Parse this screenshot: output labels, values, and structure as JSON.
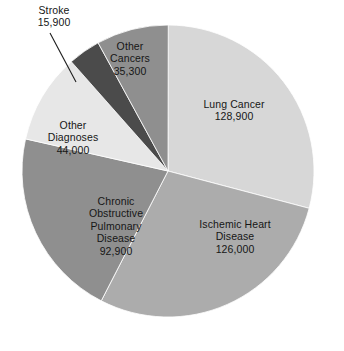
{
  "chart_data": {
    "type": "pie",
    "title": "",
    "subtitle": "",
    "xlabel": "",
    "ylabel": "",
    "legend_position": "none",
    "grid": false,
    "labels_on_slices": true,
    "total": 443000,
    "categories": [
      "Lung Cancer",
      "Ischemic Heart Disease",
      "Chronic Obstructive Pulmonary Disease",
      "Other Diagnoses",
      "Stroke",
      "Other Cancers"
    ],
    "values": [
      128900,
      126000,
      92900,
      44000,
      15900,
      35300
    ],
    "slices": [
      {
        "name": "Lung Cancer",
        "label_lines": [
          "Lung Cancer"
        ],
        "value": 128900,
        "value_text": "128,900",
        "color": "#d7d7d7",
        "start_angle": 0,
        "sweep_angle": 104.8,
        "leader_line": false
      },
      {
        "name": "Ischemic Heart Disease",
        "label_lines": [
          "Ischemic Heart",
          "Disease"
        ],
        "value": 126000,
        "value_text": "126,000",
        "color": "#acacac",
        "start_angle": 104.8,
        "sweep_angle": 102.4,
        "leader_line": false
      },
      {
        "name": "Chronic Obstructive Pulmonary Disease",
        "label_lines": [
          "Chronic",
          "Obstructive",
          "Pulmonary",
          "Disease"
        ],
        "value": 92900,
        "value_text": "92,900",
        "color": "#8f8f8f",
        "start_angle": 207.2,
        "sweep_angle": 75.5,
        "leader_line": false
      },
      {
        "name": "Other Diagnoses",
        "label_lines": [
          "Other",
          "Diagnoses"
        ],
        "value": 44000,
        "value_text": "44,000",
        "color": "#e7e7e7",
        "start_angle": 282.7,
        "sweep_angle": 35.8,
        "leader_line": false
      },
      {
        "name": "Stroke",
        "label_lines": [
          "Stroke"
        ],
        "value": 15900,
        "value_text": "15,900",
        "color": "#4b4b4b",
        "start_angle": 318.5,
        "sweep_angle": 12.9,
        "leader_line": true
      },
      {
        "name": "Other Cancers",
        "label_lines": [
          "Other",
          "Cancers"
        ],
        "value": 35300,
        "value_text": "35,300",
        "color": "#8f8f8f",
        "start_angle": 331.4,
        "sweep_angle": 28.7,
        "leader_line": false
      }
    ],
    "geometry": {
      "center_x": 168,
      "center_y": 171,
      "radius": 146
    },
    "colors": {
      "background": "#ffffff",
      "text": "#161616",
      "leader_line": "#1d1d1d"
    }
  },
  "labels": {
    "lung_cancer": {
      "line1": "Lung Cancer",
      "value": "128,900"
    },
    "ischemic_heart": {
      "line1": "Ischemic Heart",
      "line2": "Disease",
      "value": "126,000"
    },
    "copd": {
      "line1": "Chronic",
      "line2": "Obstructive",
      "line3": "Pulmonary",
      "line4": "Disease",
      "value": "92,900"
    },
    "other_diagnoses": {
      "line1": "Other",
      "line2": "Diagnoses",
      "value": "44,000"
    },
    "stroke": {
      "line1": "Stroke",
      "value": "15,900"
    },
    "other_cancers": {
      "line1": "Other",
      "line2": "Cancers",
      "value": "35,300"
    }
  }
}
